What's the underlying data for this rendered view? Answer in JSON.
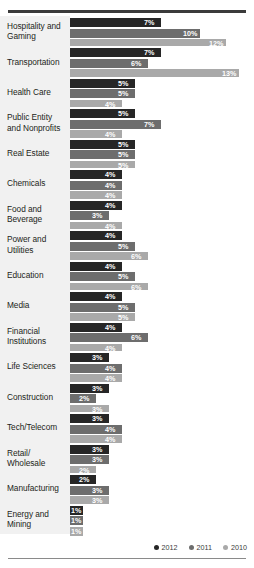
{
  "chart_data": {
    "type": "bar",
    "orientation": "horizontal",
    "grouped": true,
    "title": "",
    "subtitle": "",
    "xlabel": "",
    "ylabel": "",
    "xlim": [
      0,
      14
    ],
    "grid": false,
    "legend_position": "bottom-right",
    "value_suffix": "%",
    "categories": [
      "Hospitality and Gaming",
      "Transportation",
      "Health Care",
      "Public Entity and Nonprofits",
      "Real Estate",
      "Chemicals",
      "Food and Beverage",
      "Power and Utilities",
      "Education",
      "Media",
      "Financial Institutions",
      "Life Sciences",
      "Construction",
      "Tech/Telecom",
      "Retail/ Wholesale",
      "Manufacturing",
      "Energy and Mining"
    ],
    "series": [
      {
        "name": "2012",
        "color": "#262626",
        "values": [
          7,
          7,
          5,
          5,
          5,
          4,
          4,
          4,
          4,
          4,
          4,
          3,
          3,
          3,
          3,
          2,
          1
        ]
      },
      {
        "name": "2011",
        "color": "#6d6d6d",
        "values": [
          10,
          6,
          5,
          7,
          5,
          4,
          3,
          5,
          5,
          5,
          6,
          4,
          2,
          4,
          3,
          3,
          1
        ]
      },
      {
        "name": "2010",
        "color": "#a9a9a9",
        "values": [
          12,
          13,
          4,
          4,
          5,
          4,
          4,
          6,
          6,
          5,
          4,
          4,
          3,
          4,
          2,
          3,
          1
        ]
      }
    ],
    "labels": [
      {
        "category": "Hospitality and Gaming",
        "label_lines": [
          "Hospitality and",
          "Gaming"
        ],
        "values": [
          "7%",
          "10%",
          "12%"
        ]
      },
      {
        "category": "Transportation",
        "label_lines": [
          "Transportation"
        ],
        "values": [
          "7%",
          "6%",
          "13%"
        ]
      },
      {
        "category": "Health Care",
        "label_lines": [
          "Health Care"
        ],
        "values": [
          "5%",
          "5%",
          "4%"
        ]
      },
      {
        "category": "Public Entity and Nonprofits",
        "label_lines": [
          "Public Entity",
          "and Nonprofits"
        ],
        "values": [
          "5%",
          "7%",
          "4%"
        ]
      },
      {
        "category": "Real Estate",
        "label_lines": [
          "Real Estate"
        ],
        "values": [
          "5%",
          "5%",
          "5%"
        ]
      },
      {
        "category": "Chemicals",
        "label_lines": [
          "Chemicals"
        ],
        "values": [
          "4%",
          "4%",
          "4%"
        ]
      },
      {
        "category": "Food and Beverage",
        "label_lines": [
          "Food and",
          "Beverage"
        ],
        "values": [
          "4%",
          "3%",
          "4%"
        ]
      },
      {
        "category": "Power and Utilities",
        "label_lines": [
          "Power and",
          "Utilities"
        ],
        "values": [
          "4%",
          "5%",
          "6%"
        ]
      },
      {
        "category": "Education",
        "label_lines": [
          "Education"
        ],
        "values": [
          "4%",
          "5%",
          "6%"
        ]
      },
      {
        "category": "Media",
        "label_lines": [
          "Media"
        ],
        "values": [
          "4%",
          "5%",
          "5%"
        ]
      },
      {
        "category": "Financial Institutions",
        "label_lines": [
          "Financial",
          "Institutions"
        ],
        "values": [
          "4%",
          "6%",
          "4%"
        ]
      },
      {
        "category": "Life Sciences",
        "label_lines": [
          "Life Sciences"
        ],
        "values": [
          "3%",
          "4%",
          "4%"
        ]
      },
      {
        "category": "Construction",
        "label_lines": [
          "Construction"
        ],
        "values": [
          "3%",
          "2%",
          "3%"
        ]
      },
      {
        "category": "Tech/Telecom",
        "label_lines": [
          "Tech/Telecom"
        ],
        "values": [
          "3%",
          "4%",
          "4%"
        ]
      },
      {
        "category": "Retail/ Wholesale",
        "label_lines": [
          "Retail/",
          "Wholesale"
        ],
        "values": [
          "3%",
          "3%",
          "2%"
        ]
      },
      {
        "category": "Manufacturing",
        "label_lines": [
          "Manufacturing"
        ],
        "values": [
          "2%",
          "3%",
          "3%"
        ]
      },
      {
        "category": "Energy and Mining",
        "label_lines": [
          "Energy and",
          "Mining"
        ],
        "values": [
          "1%",
          "1%",
          "1%"
        ]
      }
    ]
  },
  "legend": {
    "items": [
      {
        "label": "2012",
        "color": "#262626"
      },
      {
        "label": "2011",
        "color": "#6d6d6d"
      },
      {
        "label": "2010",
        "color": "#a9a9a9"
      }
    ]
  }
}
